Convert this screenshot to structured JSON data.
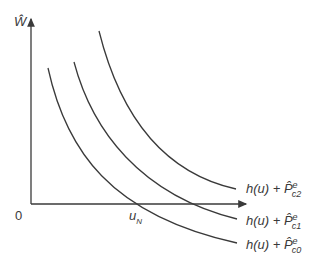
{
  "axes": {
    "y_label": "Ŵ",
    "origin_label": "0",
    "x_tick_label": "u",
    "x_tick_sub": "N"
  },
  "curves": [
    {
      "name": "curve-c2",
      "label_main": "h(u) + ",
      "label_p": "P̂",
      "label_sup": "e",
      "label_sub": "c2"
    },
    {
      "name": "curve-c1",
      "label_main": "h(u) + ",
      "label_p": "P̂",
      "label_sup": "e",
      "label_sub": "c1"
    },
    {
      "name": "curve-c0",
      "label_main": "h(u) + ",
      "label_p": "P̂",
      "label_sup": "e",
      "label_sub": "c0"
    }
  ],
  "colors": {
    "line": "#3a3a3a",
    "background": "#ffffff"
  }
}
